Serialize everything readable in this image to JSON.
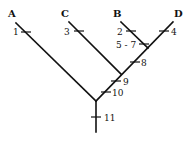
{
  "diagram": {
    "type": "cladogram",
    "taxa": [
      {
        "label": "A",
        "x": 12,
        "y": 13
      },
      {
        "label": "C",
        "x": 65,
        "y": 13
      },
      {
        "label": "B",
        "x": 117,
        "y": 13
      },
      {
        "label": "D",
        "x": 179,
        "y": 13
      }
    ],
    "characters": [
      {
        "label": "1",
        "x": 12,
        "y": 35
      },
      {
        "label": "3",
        "x": 64,
        "y": 35
      },
      {
        "label": "2",
        "x": 118,
        "y": 35
      },
      {
        "label": "5 - 7",
        "x": 116,
        "y": 48
      },
      {
        "label": "4",
        "x": 173,
        "y": 35
      },
      {
        "label": "8",
        "x": 141,
        "y": 66
      },
      {
        "label": "9",
        "x": 124,
        "y": 85
      },
      {
        "label": "10",
        "x": 114,
        "y": 96
      },
      {
        "label": "11",
        "x": 104,
        "y": 121
      }
    ]
  }
}
